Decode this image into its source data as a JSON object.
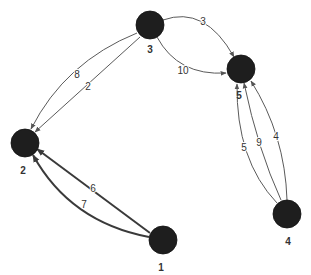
{
  "graph": {
    "directed": true,
    "colors": {
      "node_fill": "#1e1e1e",
      "edge": "#5a5a5a",
      "edge_thick": "#3a3a3a",
      "label": "#333333",
      "background": "#ffffff"
    },
    "nodes": [
      {
        "id": "1",
        "label": "1",
        "cx": 163,
        "cy": 240,
        "r": 14,
        "label_x": 161,
        "label_y": 268
      },
      {
        "id": "2",
        "label": "2",
        "cx": 25,
        "cy": 143,
        "r": 14,
        "label_x": 23,
        "label_y": 171
      },
      {
        "id": "3",
        "label": "3",
        "cx": 150,
        "cy": 25,
        "r": 14,
        "label_x": 150,
        "label_y": 50
      },
      {
        "id": "4",
        "label": "4",
        "cx": 287,
        "cy": 214,
        "r": 14,
        "label_x": 288,
        "label_y": 242
      },
      {
        "id": "5",
        "label": "5",
        "cx": 241,
        "cy": 69,
        "r": 14,
        "label_x": 239,
        "label_y": 96
      }
    ],
    "edges": [
      {
        "from": "3",
        "to": "5",
        "label": "3",
        "thick": false,
        "d": "M163,20 Q205,5 234,57",
        "label_x": 203,
        "label_y": 22
      },
      {
        "from": "3",
        "to": "5",
        "label": "10",
        "thick": false,
        "d": "M157,37 Q178,76 226,73",
        "label_x": 183,
        "label_y": 71
      },
      {
        "from": "3",
        "to": "2",
        "label": "8",
        "thick": false,
        "d": "M137,33 Q65,62 31,129",
        "label_x": 77,
        "label_y": 75
      },
      {
        "from": "3",
        "to": "2",
        "label": "2",
        "thick": false,
        "d": "M140,37 L35,132",
        "label_x": 88,
        "label_y": 87
      },
      {
        "from": "1",
        "to": "2",
        "label": "6",
        "thick": true,
        "d": "M150,233 L37,149",
        "label_x": 93,
        "label_y": 189
      },
      {
        "from": "1",
        "to": "2",
        "label": "7",
        "thick": true,
        "d": "M149,237 Q70,222 33,155",
        "label_x": 84,
        "label_y": 205
      },
      {
        "from": "4",
        "to": "5",
        "label": "5",
        "thick": false,
        "d": "M277,203 Q236,160 237,84",
        "label_x": 244,
        "label_y": 148
      },
      {
        "from": "4",
        "to": "5",
        "label": "9",
        "thick": false,
        "d": "M281,200 Q258,150 244,83",
        "label_x": 259,
        "label_y": 143
      },
      {
        "from": "4",
        "to": "5",
        "label": "4",
        "thick": false,
        "d": "M287,200 Q285,135 251,81",
        "label_x": 276,
        "label_y": 137
      }
    ]
  }
}
